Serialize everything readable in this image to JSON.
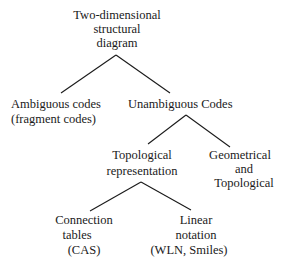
{
  "diagram": {
    "type": "tree",
    "nodes": {
      "root": {
        "lines": [
          "Two-dimensional",
          "structural",
          "diagram"
        ]
      },
      "ambiguous": {
        "lines": [
          "Ambiguous codes",
          "(fragment codes)"
        ]
      },
      "unambiguous": {
        "lines": [
          "Unambiguous Codes"
        ]
      },
      "topological": {
        "lines": [
          "Topological",
          "representation"
        ]
      },
      "geometrical": {
        "lines": [
          "Geometrical",
          "and",
          "Topological"
        ]
      },
      "connection": {
        "lines": [
          "Connection",
          "tables",
          "(CAS)"
        ]
      },
      "linear": {
        "lines": [
          "Linear",
          "notation",
          "(WLN, Smiles)"
        ]
      }
    },
    "edges": [
      [
        "root",
        "ambiguous"
      ],
      [
        "root",
        "unambiguous"
      ],
      [
        "unambiguous",
        "topological"
      ],
      [
        "unambiguous",
        "geometrical"
      ],
      [
        "topological",
        "connection"
      ],
      [
        "topological",
        "linear"
      ]
    ],
    "colors": {
      "line": "#1a1a1a",
      "text": "#1a1a1a",
      "background": "#ffffff"
    }
  }
}
